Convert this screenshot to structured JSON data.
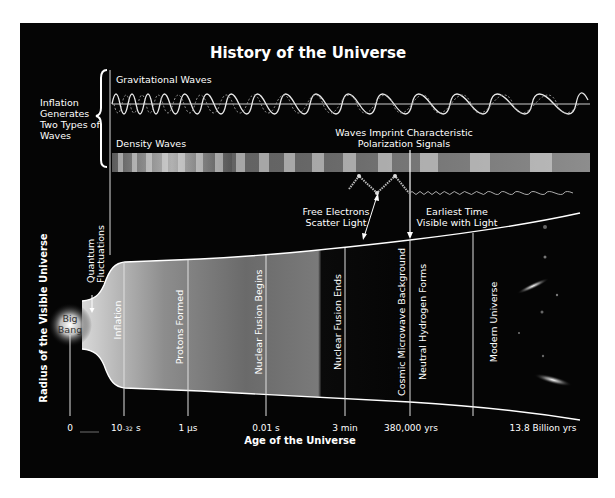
{
  "title": "History of the Universe",
  "inflation_note": {
    "lines": [
      "Inflation",
      "Generates",
      "Two Types of",
      "Waves"
    ]
  },
  "waves": {
    "gravitational_label": "Gravitational Waves",
    "density_label": "Density Waves",
    "polarization_lines": [
      "Waves Imprint Characteristic",
      "Polarization Signals"
    ]
  },
  "annotations": {
    "free_electrons": [
      "Free Electrons",
      "Scatter Light"
    ],
    "earliest_time": [
      "Earliest Time",
      "Visible with Light"
    ],
    "quantum": [
      "Quantum",
      "Fluctuations"
    ],
    "big_bang": [
      "Big",
      "Bang"
    ]
  },
  "epochs": [
    {
      "label": "Inflation"
    },
    {
      "label": "Protons Formed"
    },
    {
      "label": "Nuclear Fusion Begins"
    },
    {
      "label": "Nuclear Fusion Ends"
    },
    {
      "label": "Cosmic Microwave Background"
    },
    {
      "label": "Neutral Hydrogen Forms"
    },
    {
      "label": "Modern Universe"
    }
  ],
  "axis": {
    "x_label": "Age of the Universe",
    "y_label": "Radius of the Visible Universe",
    "ticks": [
      {
        "label": "0"
      },
      {
        "label": "10",
        "exp": "-32",
        "unit": "s"
      },
      {
        "label": "1 µs"
      },
      {
        "label": "0.01 s"
      },
      {
        "label": "3 min"
      },
      {
        "label": "380,000 yrs"
      },
      {
        "label": "13.8 Billion yrs"
      }
    ]
  },
  "colors": {
    "background": "#050505",
    "line": "#ffffff",
    "cmb_band": "#8a8a8a"
  }
}
